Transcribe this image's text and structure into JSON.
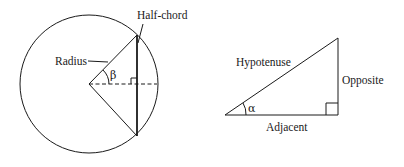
{
  "left_figure": {
    "labels": {
      "half_chord": "Half-chord",
      "radius": "Radius",
      "angle": "β"
    }
  },
  "right_figure": {
    "labels": {
      "hypotenuse": "Hypotenuse",
      "opposite": "Opposite",
      "adjacent": "Adjacent",
      "angle": "α"
    }
  },
  "colors": {
    "stroke": "#1a1a1a",
    "background": "#ffffff"
  }
}
